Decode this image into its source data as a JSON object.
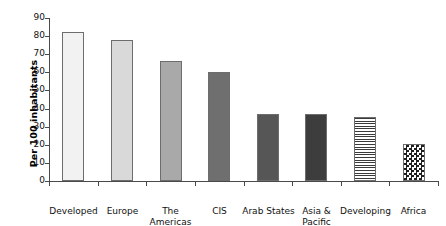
{
  "chart_data": {
    "type": "bar",
    "title": "",
    "subtitle": "",
    "xlabel": "",
    "ylabel": "Per 100 inhabitants",
    "ylim": [
      0,
      90
    ],
    "ytick_values": [
      0,
      10,
      20,
      30,
      40,
      50,
      60,
      70,
      80,
      90
    ],
    "ytick_labels": [
      "0",
      "10",
      "20",
      "30",
      "40",
      "50",
      "60",
      "70",
      "80",
      "90"
    ],
    "grid": false,
    "legend": null,
    "categories": [
      "Developed",
      "Europe",
      "The Americas",
      "CIS",
      "Arab States",
      "Asia & Pacific",
      "Developing",
      "Africa"
    ],
    "category_lines": [
      [
        "Developed"
      ],
      [
        "Europe"
      ],
      [
        "The",
        "Americas"
      ],
      [
        "CIS"
      ],
      [
        "Arab States"
      ],
      [
        "Asia &",
        "Pacific"
      ],
      [
        "Developing"
      ],
      [
        "Africa"
      ]
    ],
    "values": [
      82,
      78,
      66,
      60,
      37,
      37,
      35.5,
      20.5
    ],
    "bar_fills": [
      "very-light-gray",
      "light-gray",
      "medium-gray",
      "dark-gray",
      "darker-gray",
      "darkest-gray",
      "horizontal-stripes",
      "checkerboard"
    ],
    "bar_colors": [
      "#f2f2f2",
      "#d9d9d9",
      "#a9a9a9",
      "#6f6f6f",
      "#565656",
      "#3d3d3d",
      "#ffffff",
      "#ffffff"
    ],
    "bar_edge_color": "#6d6d6d",
    "axis_color": "#4a4a4a",
    "background_color": "#ffffff"
  }
}
